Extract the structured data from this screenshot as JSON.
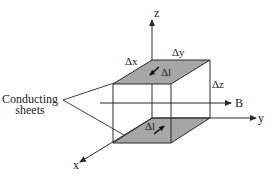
{
  "diagram": {
    "axes": {
      "x": "x",
      "y": "y",
      "z": "z"
    },
    "field_label": "B",
    "dimensions": {
      "dx": "Δx",
      "dy": "Δy",
      "dz": "Δz"
    },
    "current_element_top": "Δl",
    "current_element_bottom": "Δl",
    "callout_line1": "Conducting",
    "callout_line2": "sheets",
    "colors": {
      "sheet_fill": "#a6a6a6",
      "line": "#2a2a2a"
    }
  }
}
